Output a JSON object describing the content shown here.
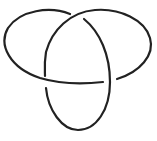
{
  "diagram": {
    "type": "knot",
    "name": "trefoil-knot",
    "crossings": 3,
    "stroke_color": "#222222",
    "background_color": "#ffffff"
  }
}
